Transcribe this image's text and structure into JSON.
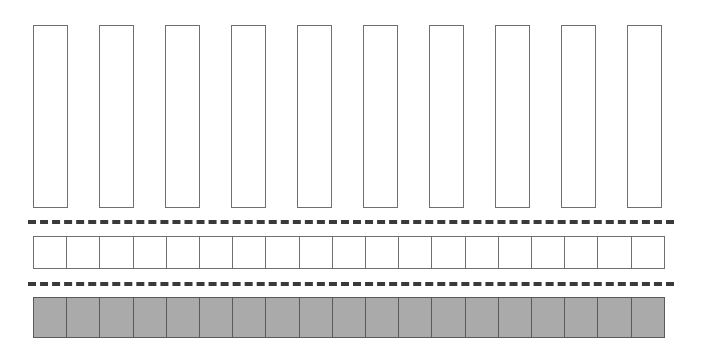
{
  "figure": {
    "background_color": "#ffffff"
  },
  "rows": [
    {
      "id": "tall-bars",
      "label": "Tall bars row",
      "shape": "rectangle-outline",
      "count": 10,
      "fill_color": "#ffffff",
      "stroke_color": "#6f6f6f",
      "bar_width_px": 35,
      "bar_height_px": 183,
      "pitch_px": 66,
      "left_px": 33,
      "top_px": 25,
      "items": [
        {
          "index": 1,
          "value": ""
        },
        {
          "index": 2,
          "value": ""
        },
        {
          "index": 3,
          "value": ""
        },
        {
          "index": 4,
          "value": ""
        },
        {
          "index": 5,
          "value": ""
        },
        {
          "index": 6,
          "value": ""
        },
        {
          "index": 7,
          "value": ""
        },
        {
          "index": 8,
          "value": ""
        },
        {
          "index": 9,
          "value": ""
        },
        {
          "index": 10,
          "value": ""
        }
      ]
    },
    {
      "id": "white-squares",
      "label": "White unit squares row",
      "shape": "square-outline",
      "count": 19,
      "fill_color": "#ffffff",
      "stroke_color": "#6f6f6f",
      "row_width_px": 632,
      "row_height_px": 33,
      "left_px": 33,
      "top_px": 236,
      "items": [
        {
          "index": 1,
          "value": ""
        },
        {
          "index": 2,
          "value": ""
        },
        {
          "index": 3,
          "value": ""
        },
        {
          "index": 4,
          "value": ""
        },
        {
          "index": 5,
          "value": ""
        },
        {
          "index": 6,
          "value": ""
        },
        {
          "index": 7,
          "value": ""
        },
        {
          "index": 8,
          "value": ""
        },
        {
          "index": 9,
          "value": ""
        },
        {
          "index": 10,
          "value": ""
        },
        {
          "index": 11,
          "value": ""
        },
        {
          "index": 12,
          "value": ""
        },
        {
          "index": 13,
          "value": ""
        },
        {
          "index": 14,
          "value": ""
        },
        {
          "index": 15,
          "value": ""
        },
        {
          "index": 16,
          "value": ""
        },
        {
          "index": 17,
          "value": ""
        },
        {
          "index": 18,
          "value": ""
        },
        {
          "index": 19,
          "value": ""
        }
      ]
    },
    {
      "id": "gray-squares",
      "label": "Gray filled unit squares row",
      "shape": "square-filled",
      "count": 19,
      "fill_color": "#aaaaaa",
      "stroke_color": "#5a5a5a",
      "row_width_px": 632,
      "row_height_px": 41,
      "left_px": 33,
      "top_px": 297,
      "items": [
        {
          "index": 1,
          "value": ""
        },
        {
          "index": 2,
          "value": ""
        },
        {
          "index": 3,
          "value": ""
        },
        {
          "index": 4,
          "value": ""
        },
        {
          "index": 5,
          "value": ""
        },
        {
          "index": 6,
          "value": ""
        },
        {
          "index": 7,
          "value": ""
        },
        {
          "index": 8,
          "value": ""
        },
        {
          "index": 9,
          "value": ""
        },
        {
          "index": 10,
          "value": ""
        },
        {
          "index": 11,
          "value": ""
        },
        {
          "index": 12,
          "value": ""
        },
        {
          "index": 13,
          "value": ""
        },
        {
          "index": 14,
          "value": ""
        },
        {
          "index": 15,
          "value": ""
        },
        {
          "index": 16,
          "value": ""
        },
        {
          "index": 17,
          "value": ""
        },
        {
          "index": 18,
          "value": ""
        },
        {
          "index": 19,
          "value": ""
        }
      ]
    }
  ],
  "separators": [
    {
      "id": "dash-1",
      "label": "Upper dashed divider",
      "style": "dashed",
      "color": "#3a3a3a",
      "thickness_px": 4,
      "dash_length_px": 12,
      "gap_length_px": 10,
      "top_px": 220,
      "left_px": 28,
      "width_px": 646
    },
    {
      "id": "dash-2",
      "label": "Lower dashed divider",
      "style": "dashed",
      "color": "#3a3a3a",
      "thickness_px": 4,
      "dash_length_px": 12,
      "gap_length_px": 10,
      "top_px": 282,
      "left_px": 28,
      "width_px": 646
    }
  ]
}
